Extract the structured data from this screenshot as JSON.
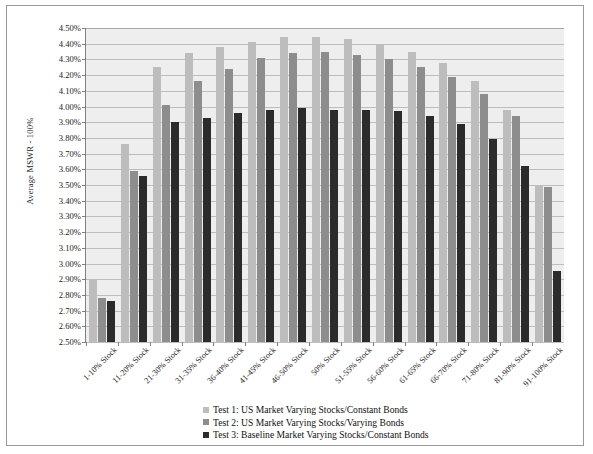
{
  "chart_data": {
    "type": "bar",
    "title": "",
    "xlabel": "",
    "ylabel": "Average MSWR - 100%",
    "ylim": [
      2.5,
      4.5
    ],
    "ytick_step": 0.1,
    "ytick_labels": [
      "4.50%",
      "4.40%",
      "4.30%",
      "4.20%",
      "4.10%",
      "4.00%",
      "3.90%",
      "3.80%",
      "3.70%",
      "3.60%",
      "3.50%",
      "3.40%",
      "3.30%",
      "3.20%",
      "3.10%",
      "3.00%",
      "2.90%",
      "2.80%",
      "2.70%",
      "2.60%",
      "2.50%"
    ],
    "grid": true,
    "legend_position": "bottom-center",
    "categories": [
      "1-10% Stock",
      "11-20% Stock",
      "21-30% Stock",
      "31-35% Stock",
      "36-40% Stock",
      "41-45% Stock",
      "46-50% Stock",
      "50% Stock",
      "51-55% Stock",
      "56-60% Stock",
      "61-65% Stock",
      "66-70% Stock",
      "71-80% Stock",
      "81-90% Stock",
      "91-100% Stock"
    ],
    "series": [
      {
        "name": "Test 1: US Market Varying Stocks/Constant Bonds",
        "color": "#bdbdbd",
        "values": [
          2.9,
          3.76,
          4.25,
          4.34,
          4.38,
          4.41,
          4.44,
          4.44,
          4.43,
          4.4,
          4.35,
          4.28,
          4.16,
          3.98,
          3.5
        ]
      },
      {
        "name": "Test 2: US Market Varying Stocks/Varying Bonds",
        "color": "#8d8d8d",
        "values": [
          2.78,
          3.59,
          4.01,
          4.16,
          4.24,
          4.31,
          4.34,
          4.35,
          4.33,
          4.3,
          4.25,
          4.19,
          4.08,
          3.94,
          3.49
        ]
      },
      {
        "name": "Test 3: Baseline Market Varying Stocks/Constant Bonds",
        "color": "#2b2b2b",
        "values": [
          2.76,
          3.56,
          3.9,
          3.93,
          3.96,
          3.98,
          3.99,
          3.98,
          3.98,
          3.97,
          3.94,
          3.89,
          3.79,
          3.62,
          2.95
        ]
      }
    ]
  }
}
